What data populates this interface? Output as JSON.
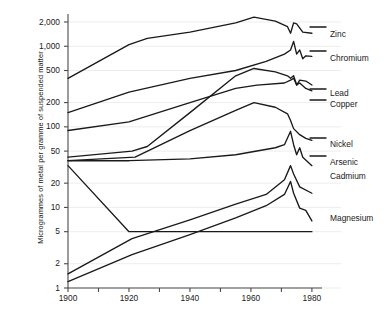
{
  "chart_data": {
    "type": "line",
    "title": "",
    "xlabel": "",
    "ylabel": "Microgrammes of metal per gramme of suspended matter",
    "xlim": [
      1900,
      1982
    ],
    "ylim": [
      1,
      2600
    ],
    "yscale": "log",
    "xscale": "linear",
    "grid": true,
    "legend_position": "right-inline",
    "ytick_labels": [
      "2,000",
      "1,000",
      "500",
      "200",
      "100",
      "50",
      "20",
      "10",
      "5",
      "2",
      "1"
    ],
    "ytick_values": [
      2000,
      1000,
      500,
      200,
      100,
      50,
      20,
      10,
      5,
      2,
      1
    ],
    "xtick_labels": [
      "1900",
      "1920",
      "1940",
      "1960",
      "1980"
    ],
    "xtick_values": [
      1900,
      1920,
      1940,
      1960,
      1980
    ],
    "xminor_ticks": [
      1910,
      1930,
      1950,
      1970
    ],
    "series": [
      {
        "name": "Zinc",
        "label": "Zinc",
        "color": "#1a1a1a",
        "x": [
          1900,
          1920,
          1926,
          1940,
          1955,
          1961,
          1968,
          1972,
          1973,
          1974,
          1975,
          1977,
          1980
        ],
        "values": [
          400,
          1050,
          1250,
          1500,
          1950,
          2300,
          2050,
          1750,
          1450,
          1950,
          1900,
          1500,
          1450
        ]
      },
      {
        "name": "Chromium",
        "label": "Chromium",
        "color": "#1a1a1a",
        "x": [
          1900,
          1920,
          1940,
          1955,
          1965,
          1971,
          1973,
          1974,
          1975,
          1976,
          1977,
          1978,
          1980
        ],
        "values": [
          150,
          270,
          400,
          500,
          650,
          800,
          900,
          1150,
          800,
          900,
          700,
          760,
          750
        ]
      },
      {
        "name": "Lead",
        "label": "Lead",
        "color": "#1a1a1a",
        "x": [
          1900,
          1921,
          1926,
          1940,
          1955,
          1961,
          1968,
          1972,
          1973,
          1974,
          1975,
          1976,
          1978,
          1980
        ],
        "values": [
          42,
          50,
          57,
          150,
          430,
          530,
          480,
          430,
          400,
          430,
          330,
          380,
          370,
          330
        ]
      },
      {
        "name": "Copper",
        "label": "Copper",
        "color": "#1a1a1a",
        "x": [
          1900,
          1920,
          1940,
          1955,
          1962,
          1971,
          1973,
          1974,
          1975,
          1976,
          1978,
          1980
        ],
        "values": [
          90,
          115,
          200,
          300,
          330,
          350,
          380,
          400,
          330,
          350,
          300,
          280
        ]
      },
      {
        "name": "Nickel",
        "label": "Nickel",
        "color": "#1a1a1a",
        "x": [
          1900,
          1922,
          1940,
          1955,
          1961,
          1968,
          1972,
          1973,
          1974,
          1976,
          1978,
          1980
        ],
        "values": [
          38,
          42,
          90,
          160,
          200,
          175,
          145,
          120,
          95,
          80,
          72,
          68
        ]
      },
      {
        "name": "Arsenic",
        "label": "Arsenic",
        "color": "#1a1a1a",
        "x": [
          1900,
          1920,
          1940,
          1955,
          1968,
          1971,
          1973,
          1974,
          1975,
          1976,
          1977,
          1980
        ],
        "values": [
          38,
          38,
          40,
          45,
          55,
          60,
          88,
          60,
          45,
          55,
          42,
          33
        ]
      },
      {
        "name": "Cadmium",
        "label": "Cadmium",
        "color": "#1a1a1a",
        "x": [
          1900,
          1920,
          1940,
          1955,
          1965,
          1971,
          1973,
          1974,
          1975,
          1977,
          1980
        ],
        "values": [
          33,
          5,
          5,
          5,
          5,
          5,
          5,
          5,
          5,
          5,
          5
        ]
      },
      {
        "name": "Magnesium upper",
        "label": "Magnesium",
        "color": "#1a1a1a",
        "x": [
          1900,
          1921,
          1940,
          1955,
          1965,
          1971,
          1973,
          1974,
          1976,
          1980
        ],
        "values": [
          1.5,
          4.1,
          7.0,
          11.0,
          14.5,
          22,
          33,
          26,
          18,
          15
        ]
      },
      {
        "name": "Magnesium lower",
        "label": "",
        "color": "#1a1a1a",
        "x": [
          1900,
          1921,
          1940,
          1955,
          1965,
          1971,
          1973,
          1974,
          1976,
          1978,
          1980
        ],
        "values": [
          1.2,
          2.6,
          4.6,
          7.4,
          10.5,
          14.5,
          21,
          15,
          9.8,
          9.2,
          6.8
        ]
      }
    ],
    "annotations": [
      {
        "name": "Zinc",
        "text": "Zinc",
        "x_px": 330,
        "y_px": 30
      },
      {
        "name": "Chromium",
        "text": "Chromium",
        "x_px": 330,
        "y_px": 54
      },
      {
        "name": "Lead",
        "text": "Lead",
        "x_px": 330,
        "y_px": 89
      },
      {
        "name": "Copper",
        "text": "Copper",
        "x_px": 330,
        "y_px": 100
      },
      {
        "name": "Nickel",
        "text": "Nickel",
        "x_px": 330,
        "y_px": 140
      },
      {
        "name": "Arsenic",
        "text": "Arsenic",
        "x_px": 330,
        "y_px": 158
      },
      {
        "name": "Cadmium",
        "text": "Cadmium",
        "x_px": 330,
        "y_px": 172
      },
      {
        "name": "Magnesium",
        "text": "Magnesium",
        "x_px": 330,
        "y_px": 214
      }
    ]
  }
}
